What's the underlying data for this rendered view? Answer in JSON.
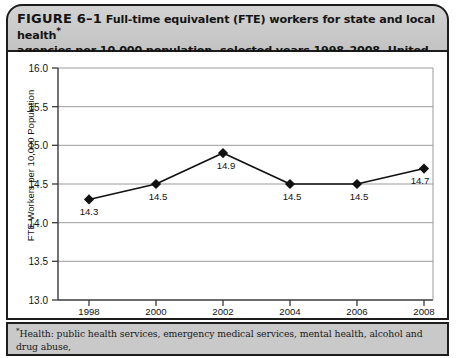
{
  "caption": {
    "figure_label": "FIGURE 6–1",
    "title_line1": "Full-time equivalent (FTE) workers for state and local health",
    "title_superscript": "*",
    "title_line2": "agencies per 10,000 population, selected years 1998–2008, United States"
  },
  "footnote": {
    "marker": "*",
    "line1": "Health: public health services, emergency medical services, mental health, alcohol and drug abuse,",
    "line2": "outpatient clinics, visiting nurses, food and sanitary inspections, animal control, other environmental"
  },
  "chart_data": {
    "type": "line",
    "title": "",
    "xlabel": "",
    "ylabel": "FTE Workers per 10,000 Population",
    "categories": [
      "1998",
      "2000",
      "2002",
      "2004",
      "2006",
      "2008"
    ],
    "values": [
      14.3,
      14.5,
      14.9,
      14.5,
      14.5,
      14.7
    ],
    "point_labels": [
      "14.3",
      "14.5",
      "14.9",
      "14.5",
      "14.5",
      "14.7"
    ],
    "ylim": [
      13.0,
      16.0
    ],
    "ytick_labels": [
      "16.0",
      "15.5",
      "15.0",
      "14.5",
      "14.0",
      "13.5",
      "13.0"
    ],
    "ytick_values": [
      16.0,
      15.5,
      15.0,
      14.5,
      14.0,
      13.5,
      13.0
    ],
    "grid": true,
    "legend": "none",
    "marker": "diamond",
    "line_color": "#111111",
    "grid_color": "#9a9a9a",
    "axis_color": "#4a4a4a"
  }
}
